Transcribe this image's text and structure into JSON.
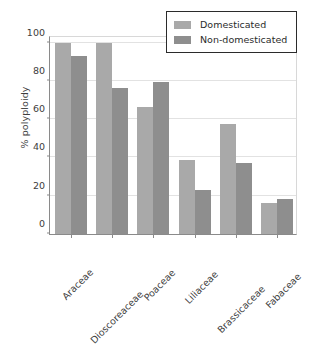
{
  "chart_data": {
    "type": "bar",
    "title": "",
    "xlabel": "",
    "ylabel": "% polyploidy",
    "categories": [
      "Araceae",
      "Dioscoreaceae",
      "Poaceae",
      "Liliaceae",
      "Brassicaceae",
      "Fabaceae"
    ],
    "series": [
      {
        "name": "Domesticated",
        "color": "#a9a9a9",
        "values": [
          100,
          100,
          66.5,
          38.5,
          57.5,
          16
        ]
      },
      {
        "name": "Non-domesticated",
        "color": "#8e8e8e",
        "values": [
          93,
          76.5,
          79.5,
          23,
          37,
          18.5
        ]
      }
    ],
    "ylim": [
      0,
      104
    ],
    "yticks": [
      0,
      20,
      40,
      60,
      80,
      100
    ],
    "ytick_labels": [
      "0",
      "20",
      "40",
      "60",
      "80",
      "100"
    ],
    "grid": "horizontal",
    "legend_position": "top-right",
    "xtick_rotation": -45
  },
  "legend": {
    "entries": [
      {
        "label": "Domesticated"
      },
      {
        "label": "Non-domesticated"
      }
    ]
  }
}
